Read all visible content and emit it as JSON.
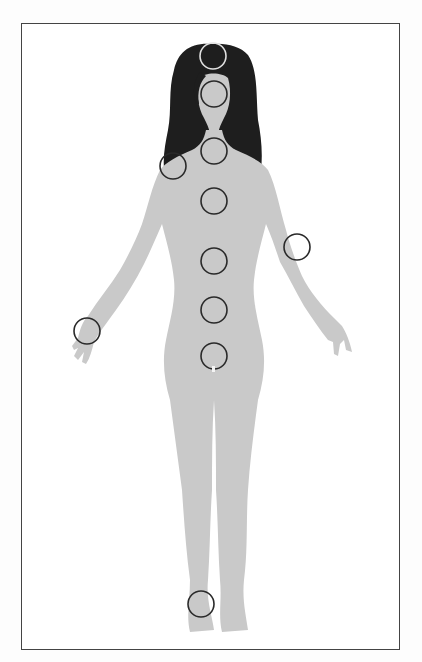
{
  "figure": {
    "colors": {
      "body": "#c9c9c9",
      "hair": "#1e1e1e",
      "frame": "#444444",
      "marker_dark": "#2a2a2a",
      "marker_light": "#e0e0e0"
    },
    "markers": [
      {
        "name": "crown-marker",
        "cx": 213,
        "cy": 56,
        "r": 13,
        "tone": "light"
      },
      {
        "name": "head-marker",
        "cx": 214,
        "cy": 94,
        "r": 13,
        "tone": "dark"
      },
      {
        "name": "throat-marker",
        "cx": 214,
        "cy": 151,
        "r": 13,
        "tone": "dark"
      },
      {
        "name": "shoulder-marker",
        "cx": 173,
        "cy": 166,
        "r": 13,
        "tone": "dark"
      },
      {
        "name": "chest-marker",
        "cx": 214,
        "cy": 201,
        "r": 13,
        "tone": "dark"
      },
      {
        "name": "elbow-marker",
        "cx": 297,
        "cy": 247,
        "r": 13,
        "tone": "dark"
      },
      {
        "name": "solar-marker",
        "cx": 214,
        "cy": 261,
        "r": 13,
        "tone": "dark"
      },
      {
        "name": "navel-marker",
        "cx": 214,
        "cy": 310,
        "r": 13,
        "tone": "dark"
      },
      {
        "name": "wrist-marker",
        "cx": 87,
        "cy": 331,
        "r": 13,
        "tone": "dark"
      },
      {
        "name": "pelvis-marker",
        "cx": 214,
        "cy": 356,
        "r": 13,
        "tone": "dark"
      },
      {
        "name": "foot-marker",
        "cx": 201,
        "cy": 604,
        "r": 13,
        "tone": "dark"
      }
    ]
  }
}
